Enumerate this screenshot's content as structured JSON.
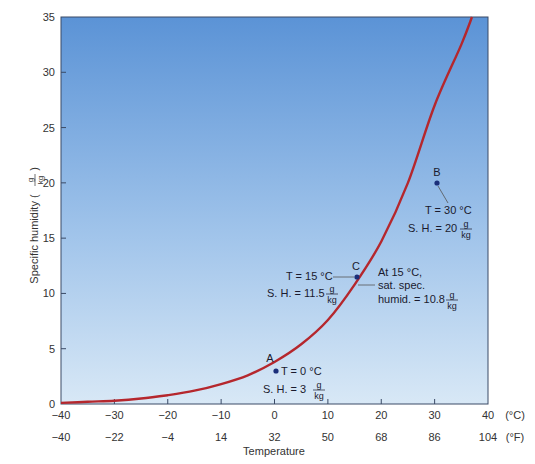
{
  "chart_data": {
    "type": "line",
    "title": "",
    "xlabel": "Temperature",
    "ylabel": "Specific humidity (g/kg)",
    "ylabel_main": "Specific humidity (",
    "ylabel_frac_num": "g",
    "ylabel_frac_den": "kg",
    "ylabel_close": ")",
    "xlim": [
      -40,
      40
    ],
    "ylim": [
      0,
      35
    ],
    "grid": false,
    "background": "blue vertical gradient (dark top, light bottom)",
    "x_ticks_c": [
      -40,
      -30,
      -20,
      -10,
      0,
      10,
      20,
      30,
      40
    ],
    "x_ticks_c_labels": [
      "-40",
      "-30",
      "-20",
      "-10",
      "0",
      "10",
      "20",
      "30",
      "40"
    ],
    "x_ticks_f_labels": [
      "-40",
      "-22",
      "-4",
      "14",
      "32",
      "50",
      "68",
      "86",
      "104"
    ],
    "x_unit_c": "(°C)",
    "x_unit_f": "(°F)",
    "y_ticks": [
      0,
      5,
      10,
      15,
      20,
      25,
      30,
      35
    ],
    "y_tick_labels": [
      "0",
      "5",
      "10",
      "15",
      "20",
      "25",
      "30",
      "35"
    ],
    "series": [
      {
        "name": "Saturation specific humidity",
        "color": "#b5272d",
        "x": [
          -40,
          -35,
          -30,
          -25,
          -20,
          -15,
          -10,
          -5,
          0,
          5,
          10,
          15,
          20,
          25,
          30,
          35,
          37
        ],
        "values": [
          0.1,
          0.2,
          0.3,
          0.5,
          0.8,
          1.2,
          1.8,
          2.6,
          3.8,
          5.4,
          7.6,
          10.8,
          14.7,
          20.0,
          27.0,
          32.5,
          35.0
        ]
      }
    ],
    "points": [
      {
        "id": "A",
        "label": "A",
        "x": 0,
        "y": 3,
        "line1": "T = 0 °C",
        "line2": "S. H. = 3"
      },
      {
        "id": "B",
        "label": "B",
        "x": 30,
        "y": 20,
        "line1": "T = 30 °C",
        "line2": "S. H. = 20"
      },
      {
        "id": "C",
        "label": "C",
        "x": 15,
        "y": 11.5,
        "line1": "T = 15 °C",
        "line2": "S. H. = 11.5"
      }
    ],
    "annotations": [
      {
        "text_lines": [
          "At 15 °C,",
          "sat. spec.",
          "humid. = 10.8"
        ],
        "unit": "g/kg",
        "x": 15,
        "y": 10.8
      }
    ],
    "unit_num": "g",
    "unit_den": "kg",
    "colors": {
      "curve": "#b5272d",
      "point": "#1b2f7a",
      "bg_top": "#5b93d6",
      "bg_bottom": "#d6e6f5",
      "frame": "#3a4a66"
    }
  }
}
